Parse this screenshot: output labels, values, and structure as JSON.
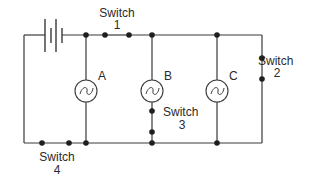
{
  "diagram": {
    "type": "electric circuit",
    "colors": {
      "wire": "#3a3a3a",
      "node": "#1e1e1e",
      "background": "#ffffff",
      "text": "#2a2a2a"
    },
    "battery": {
      "label": ""
    },
    "switches": [
      {
        "id": "switch-1",
        "label_word": "Switch",
        "label_num": "1"
      },
      {
        "id": "switch-2",
        "label_word": "Switch",
        "label_num": "2"
      },
      {
        "id": "switch-3",
        "label_word": "Switch",
        "label_num": "3"
      },
      {
        "id": "switch-4",
        "label_word": "Switch",
        "label_num": "4"
      }
    ],
    "bulbs": [
      {
        "id": "bulb-a",
        "label": "A"
      },
      {
        "id": "bulb-b",
        "label": "B"
      },
      {
        "id": "bulb-c",
        "label": "C"
      }
    ]
  }
}
